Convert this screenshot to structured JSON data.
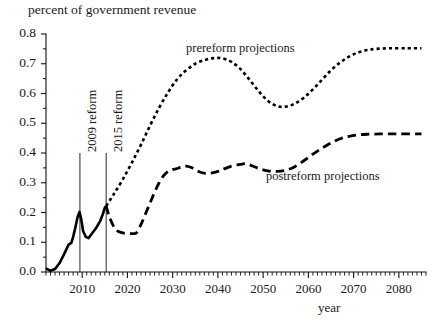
{
  "chart_data": {
    "type": "line",
    "title": "",
    "ylabel": "percent of government revenue",
    "xlabel": "year",
    "xlim": [
      2002,
      2086
    ],
    "ylim": [
      0.0,
      0.8
    ],
    "grid": false,
    "legend_position": "inline-annotations",
    "ytick_labels": [
      "0.0",
      "0.1",
      "0.2",
      "0.3",
      "0.4",
      "0.5",
      "0.6",
      "0.7",
      "0.8"
    ],
    "ytick_values": [
      0.0,
      0.1,
      0.2,
      0.3,
      0.4,
      0.5,
      0.6,
      0.7,
      0.8
    ],
    "yminor_step": 0.05,
    "xtick_labels": [
      "2010",
      "2020",
      "2030",
      "2040",
      "2050",
      "2060",
      "2070",
      "2080"
    ],
    "xtick_values": [
      2010,
      2020,
      2030,
      2040,
      2050,
      2060,
      2070,
      2080
    ],
    "xminor_step": 1,
    "annotations": [
      {
        "name": "reform-2009",
        "text": "2009 reform",
        "x": 2009.5,
        "orientation": "vertical"
      },
      {
        "name": "reform-2015",
        "text": "2015 reform",
        "x": 2015.3,
        "orientation": "vertical"
      }
    ],
    "series": [
      {
        "name": "historical",
        "label": "",
        "style": "solid",
        "points": [
          [
            2002,
            0.012
          ],
          [
            2003,
            0.004
          ],
          [
            2004,
            0.01
          ],
          [
            2005,
            0.03
          ],
          [
            2006,
            0.06
          ],
          [
            2007,
            0.092
          ],
          [
            2007.6,
            0.098
          ],
          [
            2008,
            0.118
          ],
          [
            2008.5,
            0.15
          ],
          [
            2009.0,
            0.186
          ],
          [
            2009.4,
            0.202
          ],
          [
            2009.8,
            0.176
          ],
          [
            2010.2,
            0.138
          ],
          [
            2010.8,
            0.118
          ],
          [
            2011.4,
            0.114
          ],
          [
            2012,
            0.126
          ],
          [
            2013,
            0.146
          ],
          [
            2014,
            0.172
          ],
          [
            2014.6,
            0.196
          ],
          [
            2015.0,
            0.216
          ],
          [
            2015.3,
            0.222
          ]
        ]
      },
      {
        "name": "prereform-projections",
        "label": "prereform projections",
        "style": "dotted",
        "points": [
          [
            2015.3,
            0.222
          ],
          [
            2017,
            0.262
          ],
          [
            2019,
            0.312
          ],
          [
            2021,
            0.368
          ],
          [
            2023,
            0.428
          ],
          [
            2025,
            0.492
          ],
          [
            2027,
            0.552
          ],
          [
            2029,
            0.604
          ],
          [
            2031,
            0.648
          ],
          [
            2033,
            0.678
          ],
          [
            2035,
            0.7
          ],
          [
            2037,
            0.712
          ],
          [
            2039,
            0.719
          ],
          [
            2041,
            0.718
          ],
          [
            2043,
            0.706
          ],
          [
            2045,
            0.682
          ],
          [
            2047,
            0.646
          ],
          [
            2049,
            0.608
          ],
          [
            2051,
            0.576
          ],
          [
            2053,
            0.558
          ],
          [
            2055,
            0.556
          ],
          [
            2057,
            0.566
          ],
          [
            2059,
            0.586
          ],
          [
            2061,
            0.614
          ],
          [
            2063,
            0.646
          ],
          [
            2065,
            0.678
          ],
          [
            2067,
            0.704
          ],
          [
            2069,
            0.724
          ],
          [
            2071,
            0.738
          ],
          [
            2073,
            0.746
          ],
          [
            2075,
            0.75
          ],
          [
            2078,
            0.752
          ],
          [
            2082,
            0.752
          ],
          [
            2085,
            0.752
          ]
        ]
      },
      {
        "name": "postreform-projections",
        "label": "postreform projections",
        "style": "dashed",
        "points": [
          [
            2015.3,
            0.222
          ],
          [
            2016,
            0.186
          ],
          [
            2017,
            0.152
          ],
          [
            2018,
            0.136
          ],
          [
            2019.5,
            0.13
          ],
          [
            2021,
            0.129
          ],
          [
            2022,
            0.132
          ],
          [
            2023,
            0.16
          ],
          [
            2024,
            0.196
          ],
          [
            2025,
            0.232
          ],
          [
            2026,
            0.268
          ],
          [
            2027,
            0.3
          ],
          [
            2028,
            0.324
          ],
          [
            2029,
            0.338
          ],
          [
            2030,
            0.344
          ],
          [
            2031,
            0.348
          ],
          [
            2032,
            0.354
          ],
          [
            2033,
            0.356
          ],
          [
            2034,
            0.352
          ],
          [
            2035,
            0.344
          ],
          [
            2036,
            0.336
          ],
          [
            2037,
            0.332
          ],
          [
            2038,
            0.332
          ],
          [
            2039,
            0.334
          ],
          [
            2040,
            0.338
          ],
          [
            2041,
            0.344
          ],
          [
            2043,
            0.356
          ],
          [
            2045,
            0.362
          ],
          [
            2046,
            0.364
          ],
          [
            2047,
            0.36
          ],
          [
            2049,
            0.348
          ],
          [
            2051,
            0.34
          ],
          [
            2053,
            0.338
          ],
          [
            2055,
            0.342
          ],
          [
            2057,
            0.354
          ],
          [
            2059,
            0.374
          ],
          [
            2061,
            0.396
          ],
          [
            2063,
            0.416
          ],
          [
            2065,
            0.434
          ],
          [
            2067,
            0.448
          ],
          [
            2069,
            0.456
          ],
          [
            2071,
            0.461
          ],
          [
            2073,
            0.463
          ],
          [
            2076,
            0.464
          ],
          [
            2080,
            0.464
          ],
          [
            2085,
            0.464
          ]
        ]
      }
    ]
  }
}
